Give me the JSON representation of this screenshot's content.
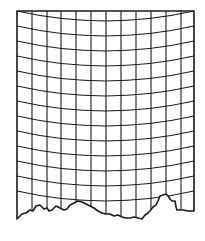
{
  "figure": {
    "stroke_color": "#1a1a1a",
    "background_color": "#ffffff",
    "frame": {
      "left": 17,
      "right": 194,
      "top": 11
    },
    "vertical_lines_x": [
      32,
      47,
      61,
      76,
      91,
      106,
      121,
      136,
      151,
      166,
      181
    ],
    "horizontal_lines": {
      "count": 13,
      "first_edge_y": 11,
      "spacing": 15,
      "sag": 10
    },
    "torn_edge_points": "17,219 22,214 26,213 30,210 33,211 36,206 40,205 44,209 47,208 49,211 52,210 56,206 60,208 64,210 67,209 70,205 74,203 78,201 82,202 86,204 90,206 94,208 98,211 102,213 106,214 110,214 114,216 118,215 122,217 126,218 130,218 134,217 138,218 142,219 145,215 148,213 150,211 153,207 156,205 158,201 160,196 163,195 166,194 168,196 170,199 172,201 175,201 176,207 177,210 183,210 188,211 194,211"
  }
}
